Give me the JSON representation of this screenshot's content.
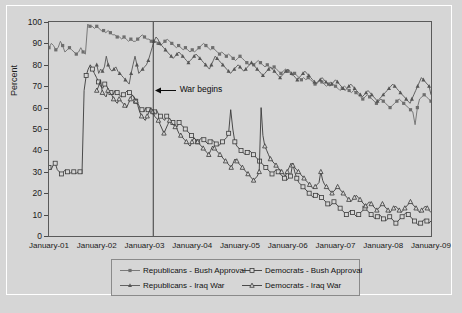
{
  "chart_data": {
    "type": "line",
    "title": "",
    "subtitle": "",
    "xlabel": "",
    "ylabel": "Percent",
    "ylim": [
      0,
      100
    ],
    "yticks": [
      0,
      10,
      20,
      30,
      40,
      50,
      60,
      70,
      80,
      90,
      100
    ],
    "xticks": [
      "January-01",
      "January-02",
      "January-03",
      "January-04",
      "January-05",
      "January-06",
      "January-07",
      "January-08",
      "January-09"
    ],
    "xlim": [
      "January-01",
      "January-09"
    ],
    "grid": false,
    "legend_position": "below-axes",
    "annotations": [
      {
        "text": "War begins",
        "x": "March-2003",
        "y": 68,
        "arrow": "left"
      }
    ],
    "series": [
      {
        "name": "Republicans - Bush Approval",
        "marker": "filled-square",
        "color": "#6e6e6e",
        "x_start": "January-01",
        "values": [
          88,
          90,
          89,
          87,
          88,
          91,
          89,
          86,
          87,
          88,
          87,
          86,
          85,
          86,
          88,
          86,
          85,
          99,
          98,
          98,
          97,
          98,
          97,
          96,
          96,
          95,
          96,
          95,
          94,
          94,
          93,
          93,
          92,
          93,
          92,
          91,
          92,
          91,
          91,
          92,
          93,
          94,
          93,
          92,
          92,
          91,
          90,
          91,
          90,
          89,
          90,
          91,
          92,
          91,
          90,
          89,
          88,
          89,
          88,
          87,
          88,
          87,
          86,
          87,
          86,
          87,
          88,
          89,
          90,
          89,
          88,
          87,
          88,
          87,
          86,
          85,
          86,
          85,
          84,
          85,
          84,
          83,
          82,
          83,
          84,
          83,
          82,
          81,
          80,
          81,
          80,
          81,
          82,
          81,
          80,
          79,
          80,
          79,
          78,
          79,
          78,
          77,
          76,
          77,
          78,
          77,
          76,
          75,
          76,
          75,
          74,
          73,
          74,
          73,
          74,
          73,
          72,
          71,
          72,
          73,
          72,
          71,
          70,
          71,
          72,
          71,
          70,
          69,
          68,
          69,
          70,
          69,
          68,
          67,
          68,
          67,
          66,
          65,
          64,
          65,
          66,
          65,
          64,
          63,
          62,
          63,
          64,
          63,
          62,
          61,
          60,
          61,
          62,
          63,
          64,
          63,
          62,
          61,
          60,
          59,
          58,
          52,
          60,
          64,
          65,
          66,
          65,
          64,
          63
        ]
      },
      {
        "name": "Republicans - Iraq War",
        "marker": "filled-triangle",
        "color": "#555555",
        "x_start": "January-02",
        "values": [
          80,
          76,
          78,
          77,
          79,
          84,
          80,
          78,
          77,
          78,
          79,
          77,
          76,
          75,
          74,
          73,
          72,
          71,
          76,
          80,
          84,
          80,
          76,
          77,
          78,
          79,
          80,
          82,
          85,
          88,
          91,
          93,
          92,
          90,
          89,
          88,
          87,
          86,
          85,
          84,
          83,
          84,
          85,
          86,
          85,
          84,
          83,
          82,
          81,
          82,
          83,
          84,
          85,
          84,
          83,
          82,
          81,
          80,
          79,
          78,
          80,
          82,
          84,
          83,
          82,
          81,
          80,
          79,
          78,
          77,
          76,
          77,
          78,
          79,
          80,
          79,
          78,
          77,
          78,
          79,
          80,
          81,
          80,
          79,
          78,
          77,
          76,
          75,
          76,
          77,
          78,
          79,
          78,
          77,
          76,
          75,
          74,
          75,
          76,
          77,
          78,
          77,
          76,
          75,
          74,
          73,
          74,
          75,
          76,
          77,
          76,
          75,
          74,
          73,
          72,
          71,
          72,
          73,
          74,
          73,
          72,
          71,
          70,
          71,
          72,
          73,
          72,
          71,
          70,
          69,
          68,
          69,
          70,
          71,
          70,
          69,
          68,
          67,
          66,
          65,
          66,
          67,
          68,
          67,
          66,
          65,
          64,
          63,
          64,
          65,
          66,
          67,
          68,
          69,
          70,
          71,
          70,
          69,
          68,
          67,
          66,
          65,
          64,
          63,
          62,
          64,
          66,
          68,
          70,
          72,
          74,
          73,
          72,
          71,
          70,
          66
        ]
      },
      {
        "name": "Democrats - Bush Approval",
        "marker": "open-square",
        "color": "#3a3a3a",
        "x_start": "January-01",
        "values": [
          32,
          31,
          33,
          34,
          31,
          30,
          29,
          30,
          31,
          30,
          29,
          30,
          30,
          29,
          30,
          30,
          29,
          68,
          75,
          78,
          80,
          78,
          76,
          74,
          72,
          70,
          69,
          71,
          70,
          68,
          67,
          66,
          68,
          67,
          66,
          65,
          66,
          67,
          68,
          67,
          66,
          65,
          63,
          62,
          60,
          59,
          58,
          60,
          59,
          58,
          57,
          58,
          59,
          57,
          56,
          55,
          54,
          56,
          55,
          54,
          53,
          52,
          51,
          53,
          52,
          51,
          50,
          49,
          48,
          47,
          46,
          45,
          44,
          45,
          46,
          45,
          44,
          43,
          44,
          45,
          44,
          43,
          42,
          43,
          44,
          45,
          46,
          48,
          59,
          50,
          44,
          42,
          41,
          40,
          39,
          38,
          39,
          40,
          39,
          38,
          37,
          36,
          35,
          34,
          33,
          32,
          31,
          30,
          29,
          30,
          31,
          30,
          29,
          28,
          27,
          26,
          27,
          28,
          34,
          30,
          27,
          25,
          24,
          23,
          22,
          21,
          20,
          19,
          18,
          19,
          20,
          19,
          18,
          17,
          16,
          15,
          14,
          15,
          16,
          15,
          14,
          13,
          12,
          11,
          10,
          11,
          12,
          11,
          10,
          9,
          10,
          11,
          12,
          13,
          12,
          11,
          10,
          9,
          8,
          9,
          10,
          9,
          8,
          7,
          8,
          9,
          8,
          7,
          6,
          7,
          8,
          9,
          10,
          11,
          10,
          9,
          8,
          7,
          6,
          5,
          6,
          7,
          8,
          7,
          6,
          7
        ]
      },
      {
        "name": "Democrats - Iraq War",
        "marker": "open-triangle",
        "color": "#3a3a3a",
        "x_start": "January-02",
        "values": [
          68,
          70,
          73,
          67,
          66,
          65,
          68,
          67,
          66,
          64,
          63,
          62,
          64,
          63,
          62,
          61,
          60,
          62,
          64,
          66,
          65,
          63,
          61,
          58,
          56,
          55,
          54,
          56,
          58,
          60,
          58,
          56,
          55,
          54,
          52,
          50,
          48,
          50,
          52,
          54,
          53,
          52,
          51,
          50,
          48,
          47,
          46,
          45,
          44,
          43,
          42,
          44,
          46,
          45,
          44,
          43,
          42,
          41,
          40,
          39,
          38,
          40,
          42,
          41,
          40,
          39,
          38,
          37,
          36,
          35,
          34,
          33,
          32,
          34,
          36,
          35,
          34,
          33,
          32,
          31,
          30,
          29,
          28,
          27,
          26,
          27,
          28,
          30,
          60,
          47,
          42,
          40,
          38,
          36,
          35,
          34,
          33,
          32,
          31,
          30,
          29,
          28,
          30,
          32,
          34,
          33,
          32,
          31,
          30,
          29,
          28,
          27,
          26,
          25,
          24,
          23,
          22,
          23,
          24,
          25,
          30,
          26,
          24,
          23,
          22,
          21,
          20,
          21,
          22,
          23,
          22,
          21,
          20,
          19,
          18,
          17,
          16,
          17,
          18,
          19,
          18,
          17,
          16,
          15,
          14,
          15,
          16,
          15,
          14,
          13,
          12,
          13,
          14,
          15,
          14,
          13,
          12,
          11,
          12,
          13,
          14,
          13,
          12,
          11,
          12,
          13,
          14,
          15,
          16,
          15,
          14,
          13,
          12,
          11,
          12,
          13,
          14,
          13,
          12,
          11
        ]
      }
    ]
  },
  "axes": {
    "ylabel": "Percent",
    "yticks": [
      "0",
      "10",
      "20",
      "30",
      "40",
      "50",
      "60",
      "70",
      "80",
      "90",
      "100"
    ],
    "xticks": [
      "January-01",
      "January-02",
      "January-03",
      "January-04",
      "January-05",
      "January-06",
      "January-07",
      "January-08",
      "January-09"
    ]
  },
  "annotation": {
    "war_begins": "War begins"
  },
  "legend": {
    "entries": [
      {
        "label": "Republicans - Bush Approval",
        "marker": "filled-square"
      },
      {
        "label": "Democrats - Bush Approval",
        "marker": "open-square"
      },
      {
        "label": "Republicans - Iraq War",
        "marker": "filled-triangle"
      },
      {
        "label": "Democrats - Iraq War",
        "marker": "open-triangle"
      }
    ]
  },
  "colors": {
    "background": "#d6d6d6",
    "republican_approval": "#6e6e6e",
    "republican_war": "#555555",
    "democrat_line": "#3a3a3a",
    "axis": "#4a4a4a",
    "war_line": "#3a3a3a"
  }
}
